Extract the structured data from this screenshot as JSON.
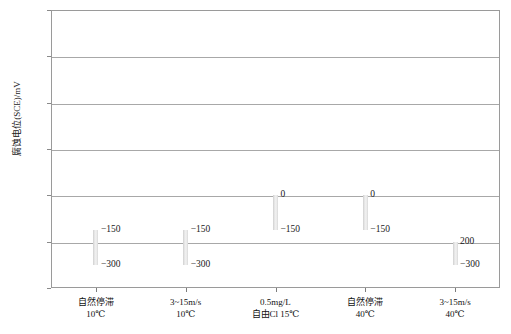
{
  "chart_data": {
    "type": "bar",
    "title": "",
    "subtitle": "",
    "xlabel": "",
    "ylabel": "腐蚀电位(SCE)/mV",
    "ylim": [
      -400,
      800
    ],
    "yticks": [
      -400,
      -200,
      0,
      200,
      400,
      600,
      800
    ],
    "ytick_labels": [
      "−400",
      "−200",
      "0",
      "200",
      "400",
      "600",
      "800"
    ],
    "grid": true,
    "legend": "none",
    "bar_style": "floating range bars (min–max interval)",
    "categories": [
      "自然停滞 10℃",
      "3~15m/s 10℃",
      "0.5mg/L 自由Cl 15℃",
      "自然停滞 40℃",
      "3~15m/s 40℃"
    ],
    "category_lines": [
      [
        "自然停滞",
        "10℃"
      ],
      [
        "3~15m/s",
        "10℃"
      ],
      [
        "0.5mg/L",
        "自由Cl 15℃"
      ],
      [
        "自然停滞",
        "40℃"
      ],
      [
        "3~15m/s",
        "40℃"
      ]
    ],
    "bars": [
      {
        "category": "自然停滞 10℃",
        "top": -150,
        "bottom": -300,
        "top_label": "−150",
        "bottom_label": "−300"
      },
      {
        "category": "3~15m/s 10℃",
        "top": -150,
        "bottom": -300,
        "top_label": "−150",
        "bottom_label": "−300"
      },
      {
        "category": "0.5mg/L 自由Cl 15℃",
        "top": 0,
        "bottom": -150,
        "top_label": "0",
        "bottom_label": "−150"
      },
      {
        "category": "自然停滞 40℃",
        "top": 0,
        "bottom": -150,
        "top_label": "0",
        "bottom_label": "−150"
      },
      {
        "category": "3~15m/s 40℃",
        "top": -200,
        "bottom": -300,
        "top_label": "200",
        "bottom_label": "−300"
      }
    ],
    "colors": {
      "bar_fill": "#e9e9e9",
      "bar_edge": "#cfcfcf",
      "grid": "#a8a8a8",
      "frame": "#9a9a9a",
      "text": "#1a1a1a",
      "background": "#ffffff"
    }
  }
}
